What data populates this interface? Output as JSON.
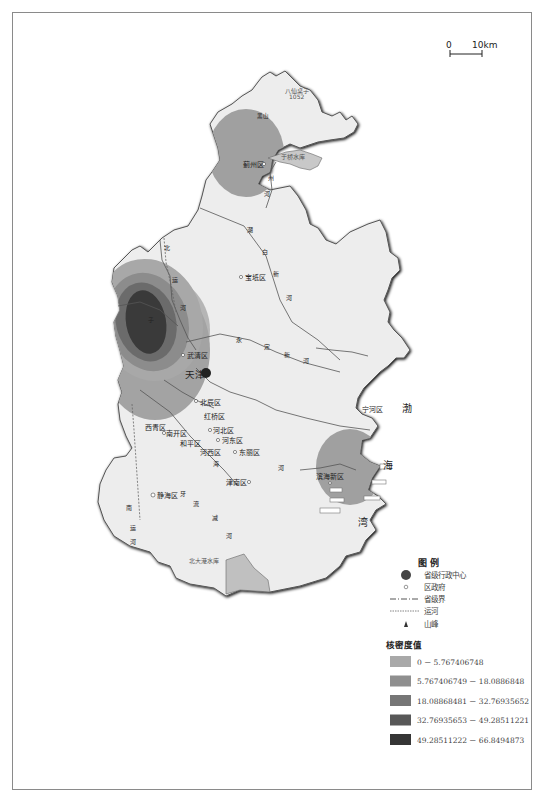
{
  "map": {
    "title": "天津市核密度分布图",
    "scale_bar": {
      "zero_label": "0",
      "distance_label": "10km"
    },
    "peak": {
      "name": "八仙桌子",
      "elevation": "1052"
    },
    "peak2": {
      "name": "黑山",
      "elevation": ""
    },
    "reservoirs": [
      {
        "name": "于桥水库"
      },
      {
        "name": "北大港水库"
      }
    ],
    "capital": {
      "name": "天津"
    },
    "districts": [
      {
        "id": "jizhou",
        "name": "蓟州区"
      },
      {
        "id": "baodi",
        "name": "宝坻区"
      },
      {
        "id": "wuqing",
        "name": "武清区"
      },
      {
        "id": "ninghe",
        "name": "宁河区"
      },
      {
        "id": "beichen",
        "name": "北辰区"
      },
      {
        "id": "hongqiao",
        "name": "红桥区"
      },
      {
        "id": "hebei",
        "name": "河北区"
      },
      {
        "id": "xiqing",
        "name": "西青区"
      },
      {
        "id": "nankai",
        "name": "南开区"
      },
      {
        "id": "hedong",
        "name": "河东区"
      },
      {
        "id": "heping",
        "name": "和平区"
      },
      {
        "id": "hexi",
        "name": "河西区"
      },
      {
        "id": "dongli",
        "name": "东丽区"
      },
      {
        "id": "jinnan",
        "name": "津南区"
      },
      {
        "id": "jinghai",
        "name": "静海区"
      },
      {
        "id": "binhai",
        "name": "滨海新区"
      }
    ],
    "rivers": {
      "chaobaixin": [
        "潮",
        "白",
        "新",
        "河"
      ],
      "yongdingxin": [
        "永",
        "定",
        "新",
        "河"
      ],
      "beiyun": [
        "北",
        "运",
        "河"
      ],
      "haihe": [
        "海",
        "河"
      ],
      "nanyun": [
        "南",
        "运",
        "河"
      ],
      "ziyaxin": [
        "子",
        "牙",
        "新",
        "河"
      ],
      "duliujian": [
        "独",
        "流",
        "减",
        "河"
      ],
      "zhouhe": [
        "州",
        "河"
      ],
      "jiyun": [
        "蓟",
        "运",
        "河"
      ]
    },
    "sea": [
      "渤",
      "海",
      "湾"
    ]
  },
  "legend": {
    "title": "图  例",
    "items": [
      {
        "symbol": "provincial-capital",
        "label": "省级行政中心"
      },
      {
        "symbol": "district-government",
        "label": "区政府"
      },
      {
        "symbol": "provincial-boundary",
        "label": "省级界"
      },
      {
        "symbol": "canal",
        "label": "运河"
      },
      {
        "symbol": "mountain-peak",
        "label": "山峰"
      }
    ],
    "density_title": "核密度值",
    "density_classes": [
      {
        "range": "0 － 5.767406748",
        "color": "#a9a9a9"
      },
      {
        "range": "5.767406749 － 18.0886848",
        "color": "#8f8f8f"
      },
      {
        "range": "18.08868481 － 32.76935652",
        "color": "#767676"
      },
      {
        "range": "32.76935653 － 49.28511221",
        "color": "#585858"
      },
      {
        "range": "49.28511222 － 66.8494873",
        "color": "#353535"
      }
    ]
  }
}
